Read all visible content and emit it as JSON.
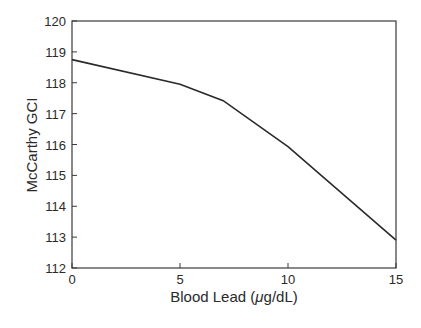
{
  "chart_data": {
    "type": "line",
    "title": "",
    "xlabel": "Blood Lead (μg/dL)",
    "ylabel": "McCarthy GCI",
    "xlim": [
      0,
      15
    ],
    "ylim": [
      112,
      120
    ],
    "xticks": [
      0,
      5,
      10,
      15
    ],
    "yticks": [
      112,
      113,
      114,
      115,
      116,
      117,
      118,
      119,
      120
    ],
    "grid": false,
    "legend": null,
    "series": [
      {
        "name": "McCarthy GCI",
        "x": [
          0,
          5,
          7,
          10,
          15
        ],
        "y": [
          118.75,
          117.95,
          117.42,
          115.93,
          112.9
        ],
        "color": "#2a2a2a"
      }
    ]
  },
  "axes": {
    "x_label_main": "Blood Lead (",
    "x_label_mu": "μ",
    "x_label_rest": "g/dL)",
    "y_label": "McCarthy GCI"
  }
}
